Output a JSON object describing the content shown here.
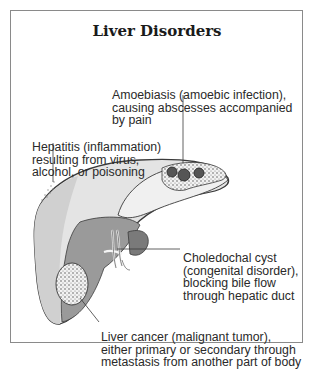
{
  "title": "Liver Disorders",
  "annotations": [
    {
      "id": "amoebiasis",
      "lines": [
        "Amoebiasis (amoebic infection),",
        "causing abscesses accompanied",
        "by pain"
      ]
    },
    {
      "id": "hepatitis",
      "lines": [
        "Hepatitis (inflammation)",
        "resulting from virus,",
        "alcohol, or poisoning"
      ]
    },
    {
      "id": "choledochal-cyst",
      "lines": [
        "Choledochal cyst",
        "(congenital disorder),",
        "blocking bile flow",
        "through hepatic duct"
      ]
    },
    {
      "id": "liver-cancer",
      "lines": [
        "Liver cancer (malignant tumor),",
        "either primary or secondary through",
        "metastasis from another part of body"
      ]
    }
  ],
  "colors": {
    "outline": "#3a3a3a",
    "liver_light": "#e6e6e6",
    "liver_mid": "#bdbdbd",
    "liver_dark": "#8c8c8c",
    "frame": "#8a8a8a"
  }
}
